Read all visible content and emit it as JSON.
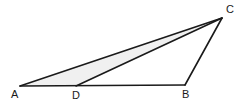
{
  "figure": {
    "background_color": "#ffffff",
    "stroke_color": "#1a1a1a",
    "shade_color": "#f0f0f0",
    "stroke_width": 1.6,
    "points": {
      "A": {
        "label": "A",
        "x": 20,
        "y": 86
      },
      "B": {
        "label": "B",
        "x": 185,
        "y": 85
      },
      "C": {
        "label": "C",
        "x": 222,
        "y": 18
      },
      "D": {
        "label": "D",
        "x": 76,
        "y": 86
      }
    },
    "segments": [
      {
        "name": "segment-AB",
        "from": "A",
        "to": "B"
      },
      {
        "name": "segment-BC",
        "from": "B",
        "to": "C"
      },
      {
        "name": "segment-CA",
        "from": "C",
        "to": "A"
      },
      {
        "name": "segment-DC",
        "from": "D",
        "to": "C"
      }
    ],
    "shaded_region": {
      "name": "triangle-ACD",
      "vertices": [
        "A",
        "C",
        "D"
      ],
      "fill": "#f0f0f0"
    },
    "labels": {
      "A": "A",
      "B": "B",
      "C": "C",
      "D": "D"
    }
  }
}
